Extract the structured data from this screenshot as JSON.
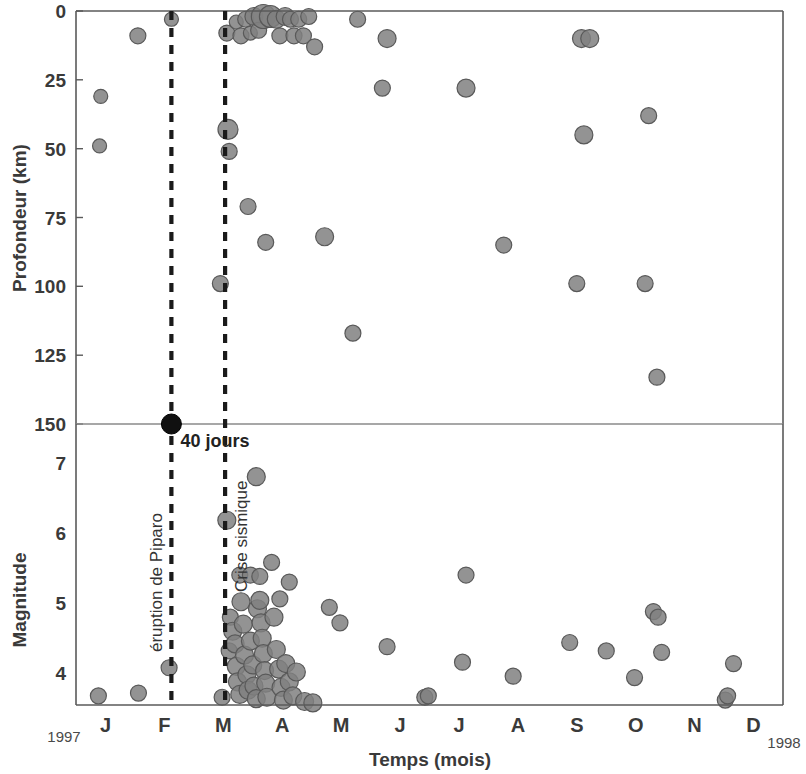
{
  "chart_data": {
    "type": "scatter",
    "title": "",
    "subtitle": "",
    "xlabel": "Temps (mois)",
    "x_start_label": "1997",
    "x_end_label": "1998",
    "categories": [
      "J",
      "F",
      "M",
      "A",
      "M",
      "J",
      "J",
      "A",
      "S",
      "O",
      "N",
      "D"
    ],
    "xlim": [
      0,
      12
    ],
    "grid": false,
    "legend": null,
    "panels": [
      {
        "name": "depth",
        "ylabel": "Profondeur (km)",
        "yticks": [
          0,
          25,
          50,
          75,
          100,
          125,
          150
        ],
        "ylim": [
          0,
          150
        ],
        "y_inverted": true,
        "points": [
          {
            "x": 0.42,
            "y": 31,
            "r": 7
          },
          {
            "x": 0.4,
            "y": 49,
            "r": 7
          },
          {
            "x": 1.05,
            "y": 9,
            "r": 8
          },
          {
            "x": 1.62,
            "y": 3,
            "r": 7
          },
          {
            "x": 2.56,
            "y": 8,
            "r": 8
          },
          {
            "x": 2.58,
            "y": 43,
            "r": 10
          },
          {
            "x": 2.6,
            "y": 51,
            "r": 8
          },
          {
            "x": 2.45,
            "y": 99,
            "r": 8
          },
          {
            "x": 2.72,
            "y": 4,
            "r": 7
          },
          {
            "x": 2.8,
            "y": 9,
            "r": 8
          },
          {
            "x": 2.88,
            "y": 3,
            "r": 8
          },
          {
            "x": 2.96,
            "y": 8,
            "r": 7
          },
          {
            "x": 3.02,
            "y": 2,
            "r": 9
          },
          {
            "x": 3.1,
            "y": 7,
            "r": 8
          },
          {
            "x": 3.18,
            "y": 2,
            "r": 12
          },
          {
            "x": 3.3,
            "y": 2,
            "r": 11
          },
          {
            "x": 3.4,
            "y": 3,
            "r": 9
          },
          {
            "x": 3.46,
            "y": 9,
            "r": 8
          },
          {
            "x": 3.55,
            "y": 2,
            "r": 9
          },
          {
            "x": 3.64,
            "y": 3,
            "r": 8
          },
          {
            "x": 3.7,
            "y": 9,
            "r": 8
          },
          {
            "x": 3.78,
            "y": 3,
            "r": 8
          },
          {
            "x": 3.86,
            "y": 9,
            "r": 8
          },
          {
            "x": 3.95,
            "y": 2,
            "r": 8
          },
          {
            "x": 4.05,
            "y": 13,
            "r": 8
          },
          {
            "x": 2.92,
            "y": 71,
            "r": 8
          },
          {
            "x": 3.22,
            "y": 84,
            "r": 8
          },
          {
            "x": 4.22,
            "y": 82,
            "r": 9
          },
          {
            "x": 4.7,
            "y": 117,
            "r": 8
          },
          {
            "x": 4.78,
            "y": 3,
            "r": 8
          },
          {
            "x": 5.2,
            "y": 28,
            "r": 8
          },
          {
            "x": 5.28,
            "y": 10,
            "r": 9
          },
          {
            "x": 6.62,
            "y": 28,
            "r": 9
          },
          {
            "x": 7.26,
            "y": 85,
            "r": 8
          },
          {
            "x": 8.5,
            "y": 99,
            "r": 8
          },
          {
            "x": 8.62,
            "y": 45,
            "r": 9
          },
          {
            "x": 8.58,
            "y": 10,
            "r": 9
          },
          {
            "x": 8.72,
            "y": 10,
            "r": 9
          },
          {
            "x": 9.66,
            "y": 99,
            "r": 8
          },
          {
            "x": 9.72,
            "y": 38,
            "r": 8
          },
          {
            "x": 9.86,
            "y": 133,
            "r": 8
          }
        ]
      },
      {
        "name": "magnitude",
        "ylabel": "Magnitude",
        "yticks": [
          4,
          5,
          6,
          7
        ],
        "ylim": [
          3.55,
          7.55
        ],
        "y_inverted": false,
        "points": [
          {
            "x": 0.38,
            "y": 3.68,
            "r": 8
          },
          {
            "x": 1.06,
            "y": 3.72,
            "r": 8
          },
          {
            "x": 1.58,
            "y": 4.08,
            "r": 8
          },
          {
            "x": 2.48,
            "y": 3.66,
            "r": 8
          },
          {
            "x": 2.56,
            "y": 6.18,
            "r": 9
          },
          {
            "x": 2.6,
            "y": 4.32,
            "r": 8
          },
          {
            "x": 2.62,
            "y": 4.8,
            "r": 8
          },
          {
            "x": 2.66,
            "y": 4.6,
            "r": 9
          },
          {
            "x": 2.7,
            "y": 4.42,
            "r": 9
          },
          {
            "x": 2.72,
            "y": 4.1,
            "r": 9
          },
          {
            "x": 2.74,
            "y": 3.88,
            "r": 9
          },
          {
            "x": 2.78,
            "y": 3.7,
            "r": 9
          },
          {
            "x": 2.8,
            "y": 5.02,
            "r": 9
          },
          {
            "x": 2.84,
            "y": 4.7,
            "r": 9
          },
          {
            "x": 2.86,
            "y": 4.26,
            "r": 9
          },
          {
            "x": 2.9,
            "y": 3.98,
            "r": 9
          },
          {
            "x": 2.92,
            "y": 3.76,
            "r": 9
          },
          {
            "x": 2.96,
            "y": 4.46,
            "r": 9
          },
          {
            "x": 3.0,
            "y": 4.12,
            "r": 9
          },
          {
            "x": 3.02,
            "y": 3.82,
            "r": 9
          },
          {
            "x": 3.06,
            "y": 3.64,
            "r": 9
          },
          {
            "x": 3.08,
            "y": 4.92,
            "r": 9
          },
          {
            "x": 3.12,
            "y": 5.04,
            "r": 9
          },
          {
            "x": 3.14,
            "y": 4.72,
            "r": 9
          },
          {
            "x": 3.16,
            "y": 4.5,
            "r": 9
          },
          {
            "x": 3.18,
            "y": 4.28,
            "r": 9
          },
          {
            "x": 3.2,
            "y": 4.04,
            "r": 9
          },
          {
            "x": 3.22,
            "y": 3.86,
            "r": 9
          },
          {
            "x": 3.24,
            "y": 3.66,
            "r": 9
          },
          {
            "x": 3.06,
            "y": 6.8,
            "r": 9
          },
          {
            "x": 2.78,
            "y": 5.4,
            "r": 8
          },
          {
            "x": 2.96,
            "y": 5.4,
            "r": 8
          },
          {
            "x": 3.12,
            "y": 5.38,
            "r": 8
          },
          {
            "x": 3.32,
            "y": 5.58,
            "r": 8
          },
          {
            "x": 3.36,
            "y": 4.8,
            "r": 9
          },
          {
            "x": 3.4,
            "y": 4.34,
            "r": 9
          },
          {
            "x": 3.44,
            "y": 4.06,
            "r": 9
          },
          {
            "x": 3.48,
            "y": 3.8,
            "r": 9
          },
          {
            "x": 3.52,
            "y": 3.62,
            "r": 9
          },
          {
            "x": 3.56,
            "y": 4.14,
            "r": 9
          },
          {
            "x": 3.62,
            "y": 3.88,
            "r": 9
          },
          {
            "x": 3.68,
            "y": 3.68,
            "r": 9
          },
          {
            "x": 3.74,
            "y": 4.02,
            "r": 9
          },
          {
            "x": 3.46,
            "y": 5.06,
            "r": 8
          },
          {
            "x": 3.62,
            "y": 5.3,
            "r": 8
          },
          {
            "x": 3.88,
            "y": 3.6,
            "r": 9
          },
          {
            "x": 4.02,
            "y": 3.58,
            "r": 9
          },
          {
            "x": 4.3,
            "y": 4.94,
            "r": 8
          },
          {
            "x": 4.48,
            "y": 4.72,
            "r": 8
          },
          {
            "x": 5.28,
            "y": 4.38,
            "r": 8
          },
          {
            "x": 5.92,
            "y": 3.66,
            "r": 8
          },
          {
            "x": 5.98,
            "y": 3.68,
            "r": 8
          },
          {
            "x": 6.56,
            "y": 4.16,
            "r": 8
          },
          {
            "x": 6.62,
            "y": 5.4,
            "r": 8
          },
          {
            "x": 7.42,
            "y": 3.96,
            "r": 8
          },
          {
            "x": 8.38,
            "y": 4.44,
            "r": 8
          },
          {
            "x": 9.0,
            "y": 4.32,
            "r": 8
          },
          {
            "x": 9.48,
            "y": 3.94,
            "r": 8
          },
          {
            "x": 9.8,
            "y": 4.88,
            "r": 8
          },
          {
            "x": 9.88,
            "y": 4.8,
            "r": 8
          },
          {
            "x": 9.94,
            "y": 4.3,
            "r": 8
          },
          {
            "x": 11.02,
            "y": 3.62,
            "r": 8
          },
          {
            "x": 11.06,
            "y": 3.68,
            "r": 8
          },
          {
            "x": 11.16,
            "y": 4.14,
            "r": 8
          }
        ]
      }
    ],
    "event_lines": [
      {
        "name": "eruption",
        "x": 1.62,
        "label": "éruption de Piparo"
      },
      {
        "name": "crisis",
        "x": 2.53,
        "label": "Crise sismique"
      }
    ],
    "interval_annotation": {
      "label": "40 jours",
      "from_x": 1.62,
      "to_x": 2.53
    },
    "marker_event": {
      "x": 1.62,
      "y": 150,
      "label": "eruption-marker"
    }
  },
  "colors": {
    "marker_fill": "#808080",
    "marker_stroke": "#595959",
    "axis": "#5a5a5a",
    "text": "#3a3a3a",
    "event_line": "#1a1a1a",
    "divider": "#8a8a8a",
    "background": "#ffffff"
  }
}
